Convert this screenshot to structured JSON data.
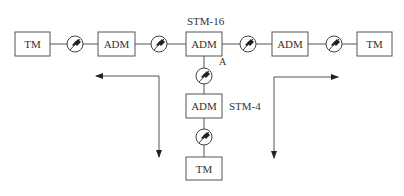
{
  "diagram": {
    "type": "SDH network topology",
    "labels": {
      "stm16": "STM-16",
      "stm4": "STM-4",
      "point_a": "A"
    },
    "nodes": [
      {
        "id": "tm-left",
        "label": "TM"
      },
      {
        "id": "adm-1",
        "label": "ADM"
      },
      {
        "id": "adm-center",
        "label": "ADM"
      },
      {
        "id": "adm-right",
        "label": "ADM"
      },
      {
        "id": "tm-right",
        "label": "TM"
      },
      {
        "id": "adm-stm4",
        "label": "ADM"
      },
      {
        "id": "tm-bottom",
        "label": "TM"
      }
    ],
    "regenerators": [
      {
        "id": "reg-1",
        "between": [
          "tm-left",
          "adm-1"
        ]
      },
      {
        "id": "reg-2",
        "between": [
          "adm-1",
          "adm-center"
        ]
      },
      {
        "id": "reg-3",
        "between": [
          "adm-center",
          "adm-right"
        ]
      },
      {
        "id": "reg-4",
        "between": [
          "adm-right",
          "tm-right"
        ]
      },
      {
        "id": "reg-5",
        "between": [
          "adm-center",
          "adm-stm4"
        ]
      },
      {
        "id": "reg-6",
        "between": [
          "adm-stm4",
          "tm-bottom"
        ]
      }
    ],
    "arrows": [
      {
        "id": "left-flow",
        "directions": [
          "left",
          "down"
        ]
      },
      {
        "id": "right-flow",
        "directions": [
          "right",
          "down"
        ]
      }
    ]
  }
}
